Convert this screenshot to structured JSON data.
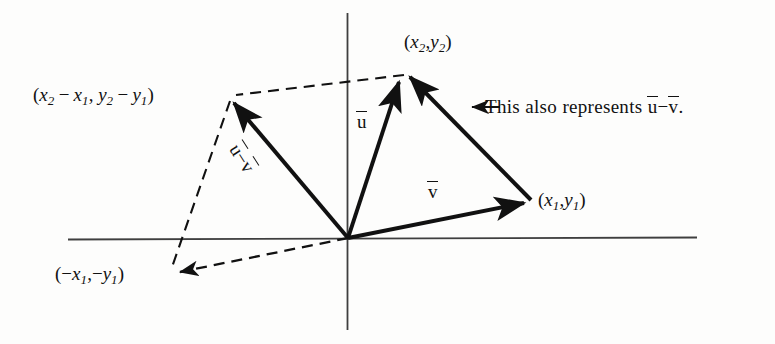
{
  "figure": {
    "type": "vector-subtraction-diagram",
    "background_color": "#fdfdfc",
    "ink_color": "#111111",
    "axes": {
      "name": "cartesian-axes",
      "origin": [
        348,
        238
      ],
      "x_axis": {
        "from": [
          68,
          239
        ],
        "to": [
          697,
          238
        ]
      },
      "y_axis": {
        "from": [
          347,
          13
        ],
        "to": [
          347,
          330
        ]
      },
      "stroke_color": "#3a3a3a"
    },
    "points": {
      "x2y2": {
        "label": "(x2,y2)",
        "at": [
          405,
          74
        ]
      },
      "x1y1": {
        "label": "(x1,y1)",
        "at": [
          533,
          201
        ]
      },
      "difference": {
        "label": "(x2 - x1, y2 - y1)",
        "at": [
          228,
          97
        ]
      },
      "negative": {
        "label": "(-x1,-y1)",
        "at": [
          168,
          273
        ]
      }
    },
    "vectors": [
      {
        "name": "vector-u",
        "label": "u",
        "from": [
          348,
          238
        ],
        "to": [
          400,
          78
        ],
        "style": "solid",
        "arrow": true
      },
      {
        "name": "vector-v",
        "label": "v",
        "from": [
          348,
          238
        ],
        "to": [
          528,
          203
        ],
        "style": "solid",
        "arrow": true
      },
      {
        "name": "vector-u-minus-v",
        "label": "u - v",
        "from": [
          348,
          238
        ],
        "to": [
          230,
          99
        ],
        "style": "solid",
        "arrow": true
      },
      {
        "name": "segment-v-to-u",
        "label": "",
        "from": [
          528,
          203
        ],
        "to": [
          409,
          72
        ],
        "style": "solid",
        "arrow": true
      },
      {
        "name": "dashed-top",
        "label": "",
        "from": [
          405,
          75
        ],
        "to": [
          232,
          96
        ],
        "style": "dashed",
        "arrow": false
      },
      {
        "name": "dashed-left",
        "label": "",
        "from": [
          231,
          99
        ],
        "to": [
          170,
          272
        ],
        "style": "dashed",
        "arrow": false
      },
      {
        "name": "dashed-origin-to-neg",
        "label": "",
        "from": [
          348,
          238
        ],
        "to": [
          172,
          274
        ],
        "style": "dashed",
        "arrow": true
      }
    ]
  },
  "labels": {
    "point_x2y2": {
      "name": "point-label-x2y2",
      "open": "(",
      "x": "x",
      "x_sub": "2",
      "comma": ",",
      "y": "y",
      "y_sub": "2",
      "close": ")"
    },
    "point_x1y1": {
      "name": "point-label-x1y1",
      "open": "(",
      "x": "x",
      "x_sub": "1",
      "comma": ",",
      "y": "y",
      "y_sub": "1",
      "close": ")"
    },
    "point_difference": {
      "name": "point-label-difference",
      "open": "(",
      "x2": "x",
      "x2_sub": "2",
      "minus1": "−",
      "x1": "x",
      "x1_sub": "1",
      "comma": ",",
      "y2": "y",
      "y2_sub": "2",
      "minus2": "−",
      "y1": "y",
      "y1_sub": "1",
      "close": ")"
    },
    "point_negative": {
      "name": "point-label-negative",
      "open": "(",
      "minus1": "−",
      "x": "x",
      "x_sub": "1",
      "comma": ",",
      "minus2": "−",
      "y": "y",
      "y_sub": "1",
      "close": ")"
    },
    "vector_u": {
      "name": "vector-label-u",
      "text": "u"
    },
    "vector_v": {
      "name": "vector-label-v",
      "text": "v"
    },
    "vector_u_minus_v": {
      "name": "vector-label-u-minus-v",
      "u": "u",
      "minus": "−",
      "v": "v"
    },
    "callout": {
      "name": "callout-annotation",
      "arrow": "←",
      "word1": "This",
      "word2": "also",
      "word3": "represents",
      "u": "u",
      "minus": "−",
      "v": "v",
      "period": "."
    }
  }
}
